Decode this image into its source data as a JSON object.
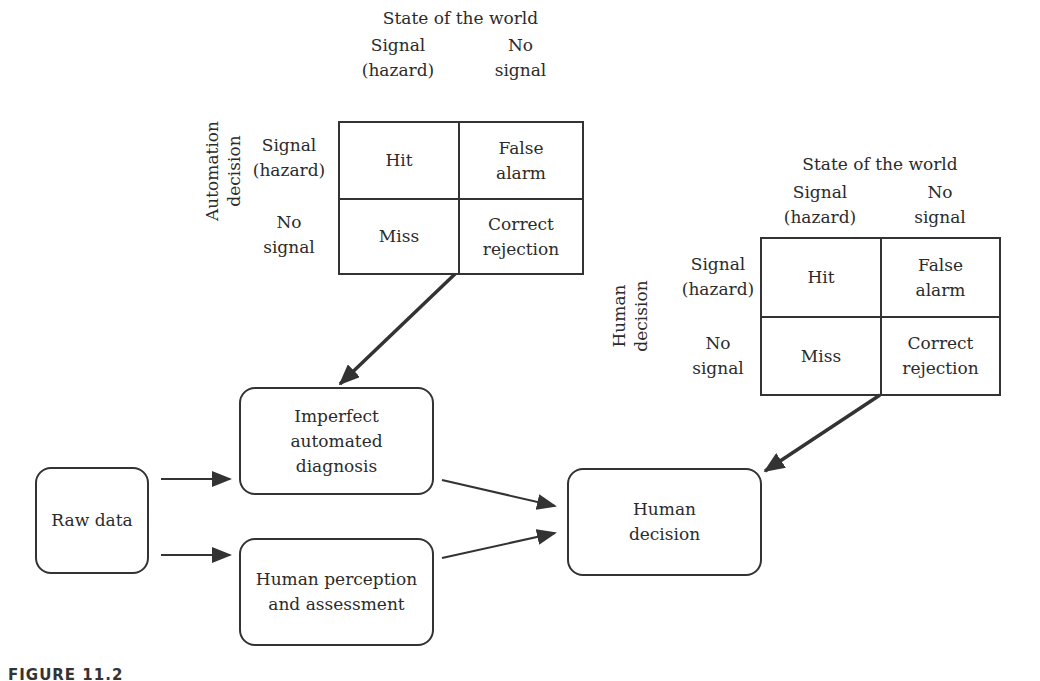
{
  "automation_matrix": {
    "title": "State of the world",
    "row_axis_label": "Automation\ndecision",
    "col_headers": [
      "Signal\n(hazard)",
      "No\nsignal"
    ],
    "row_headers": [
      "Signal\n(hazard)",
      "No\nsignal"
    ],
    "cells": [
      [
        "Hit",
        "False\nalarm"
      ],
      [
        "Miss",
        "Correct\nrejection"
      ]
    ]
  },
  "human_matrix": {
    "title": "State of the world",
    "row_axis_label": "Human\ndecision",
    "col_headers": [
      "Signal\n(hazard)",
      "No\nsignal"
    ],
    "row_headers": [
      "Signal\n(hazard)",
      "No\nsignal"
    ],
    "cells": [
      [
        "Hit",
        "False\nalarm"
      ],
      [
        "Miss",
        "Correct\nrejection"
      ]
    ]
  },
  "nodes": {
    "raw_data": "Raw data",
    "automated_diagnosis": "Imperfect\nautomated\ndiagnosis",
    "human_perception": "Human perception\nand assessment",
    "human_decision": "Human\ndecision"
  },
  "caption": "FIGURE 11.2"
}
